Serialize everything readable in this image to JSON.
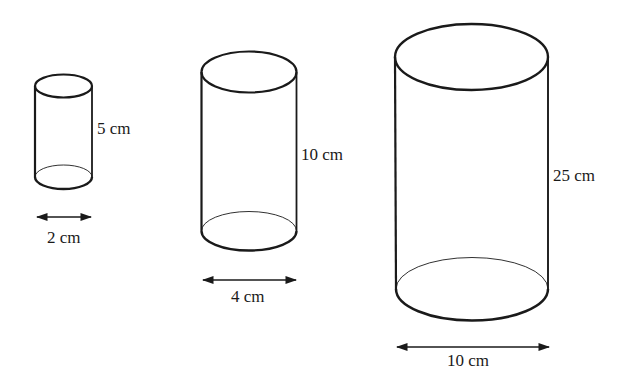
{
  "diagram": {
    "stroke_color": "#1a1a1a",
    "background": "#ffffff",
    "cylinders": [
      {
        "name": "small",
        "height_label": "5 cm",
        "diameter_label": "2 cm",
        "height_value": 5,
        "diameter_value": 2,
        "unit": "cm"
      },
      {
        "name": "medium",
        "height_label": "10 cm",
        "diameter_label": "4 cm",
        "height_value": 10,
        "diameter_value": 4,
        "unit": "cm"
      },
      {
        "name": "large",
        "height_label": "25 cm",
        "diameter_label": "10 cm",
        "height_value": 25,
        "diameter_value": 10,
        "unit": "cm"
      }
    ]
  }
}
